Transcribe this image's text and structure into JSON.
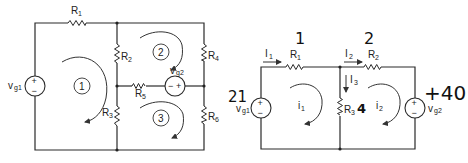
{
  "left_circuit": {
    "sources": [
      {
        "name": "vg1",
        "label": "v",
        "sub": "g1",
        "polarity": "+ top, - bottom"
      },
      {
        "name": "vg2",
        "label": "v",
        "sub": "g2",
        "polarity": "- left, + right"
      }
    ],
    "resistors": [
      {
        "label": "R",
        "sub": "1"
      },
      {
        "label": "R",
        "sub": "2"
      },
      {
        "label": "R",
        "sub": "3"
      },
      {
        "label": "R",
        "sub": "4"
      },
      {
        "label": "R",
        "sub": "5"
      },
      {
        "label": "R",
        "sub": "6"
      }
    ],
    "meshes": [
      {
        "number": "1",
        "direction": "clockwise"
      },
      {
        "number": "2",
        "direction": "clockwise"
      },
      {
        "number": "3",
        "direction": "clockwise"
      }
    ]
  },
  "right_circuit": {
    "sources": [
      {
        "name": "vg1",
        "label": "v",
        "sub": "g1",
        "plus": "+",
        "minus": "−"
      },
      {
        "name": "vg2",
        "label": "v",
        "sub": "g2",
        "plus": "+",
        "minus": "−"
      }
    ],
    "resistors": [
      {
        "label": "R",
        "sub": "1"
      },
      {
        "label": "R",
        "sub": "2"
      },
      {
        "label": "R",
        "sub": "3"
      }
    ],
    "currents": [
      {
        "label": "I",
        "sub": "1"
      },
      {
        "label": "I",
        "sub": "2"
      },
      {
        "label": "I",
        "sub": "3"
      }
    ],
    "mesh_currents": [
      {
        "label": "i",
        "sub": "1"
      },
      {
        "label": "i",
        "sub": "2"
      }
    ],
    "handwritten": {
      "vg1_value": "21",
      "r1_value": "1",
      "r2_value": "2",
      "r3_value": "4",
      "vg2_value": "+40"
    }
  },
  "symbols": {
    "plus": "+",
    "minus": "−"
  }
}
